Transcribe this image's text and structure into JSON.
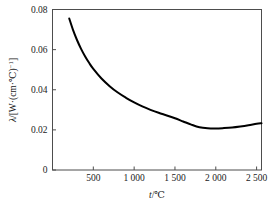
{
  "figure": {
    "background_color": "#ffffff",
    "frame_color": "#4d4d4d",
    "curve_color": "#000000"
  },
  "axes": {
    "y_title_parts": {
      "lambda": "λ",
      "slash_open": "/[W·(cm·",
      "degree_c": "℃",
      "close": ")",
      "exponent": "−1",
      "bracket": "]"
    },
    "y_title_full": "λ/[W·(cm·℃)⁻¹]",
    "x_title_parts": {
      "symbol": "t",
      "slash": "/",
      "unit": "℃"
    },
    "x_title_full": "t/℃",
    "y_ticks": [
      "0",
      "0.02",
      "0.04",
      "0.06",
      "0.08"
    ],
    "y_tick_values": [
      0,
      0.02,
      0.04,
      0.06,
      0.08
    ],
    "x_ticks": [
      "500",
      "1 000",
      "1 500",
      "2 000",
      "2 500"
    ],
    "x_tick_values": [
      500,
      1000,
      1500,
      2000,
      2500
    ]
  },
  "chart_data": {
    "type": "line",
    "title": "",
    "subtitle": "",
    "xlabel": "t/℃",
    "ylabel": "λ/[W·(cm·℃)⁻¹]",
    "xlim": [
      0,
      2560
    ],
    "ylim": [
      0,
      0.08
    ],
    "grid": false,
    "legend": false,
    "legend_position": "none",
    "x_ticklabels": [
      "500",
      "1 000",
      "1 500",
      "2 000",
      "2 500"
    ],
    "y_ticklabels": [
      "0",
      "0.02",
      "0.04",
      "0.06",
      "0.08"
    ],
    "series": [
      {
        "name": "thermal conductivity",
        "color": "#000000",
        "linewidth": 2,
        "x": [
          205,
          250,
          300,
          350,
          400,
          450,
          500,
          600,
          700,
          800,
          900,
          1000,
          1100,
          1200,
          1300,
          1400,
          1500,
          1600,
          1700,
          1800,
          1900,
          2000,
          2100,
          2200,
          2300,
          2400,
          2500,
          2560
        ],
        "y": [
          0.0755,
          0.07,
          0.0648,
          0.0604,
          0.0566,
          0.0533,
          0.0504,
          0.0456,
          0.0418,
          0.0386,
          0.036,
          0.0337,
          0.0317,
          0.03,
          0.0285,
          0.0272,
          0.0258,
          0.0242,
          0.0226,
          0.0213,
          0.0208,
          0.0207,
          0.0209,
          0.0212,
          0.0217,
          0.0223,
          0.023,
          0.0233
        ]
      }
    ],
    "annotations": []
  }
}
